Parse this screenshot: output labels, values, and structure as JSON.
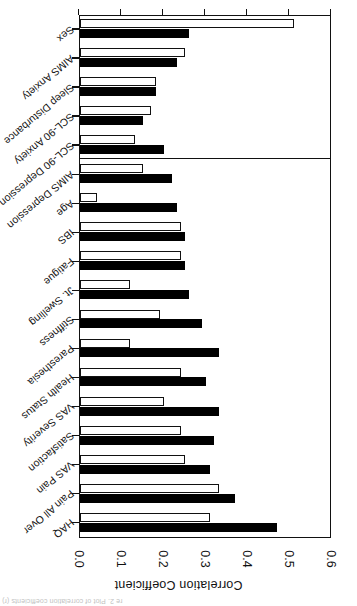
{
  "figure": {
    "cropped_caption": "re 2. Plot of correlation coefficients (r)",
    "orientation_note": "page scanned upside down"
  },
  "chart_data": {
    "type": "bar",
    "orientation": "horizontal",
    "title": "",
    "xlabel": "",
    "ylabel": "Correlation Coefficient",
    "axis_title": "Correlation Coefficient",
    "value_axis_ticks": [
      "0.0",
      "0.1",
      "0.2",
      "0.3",
      "0.4",
      "0.5",
      "0.6"
    ],
    "value_axis_tick_values": [
      0.0,
      0.1,
      0.2,
      0.3,
      0.4,
      0.5,
      0.6
    ],
    "xlim": [
      0.0,
      0.6
    ],
    "grid": false,
    "legend_position": "none",
    "separator_after_category_index": 12,
    "categories": [
      "HAQ",
      "Pain All Over",
      "VAS Pain",
      "Satisfaction",
      "VAS Severity",
      "Health Status",
      "Paresthesia",
      "Stiffness",
      "Jt. Swelling",
      "Fatigue",
      "IBS",
      "Age",
      "AIMS Depression",
      "SCL-90 Depression",
      "SCL-90 Anxiety",
      "Sleep Disturbance",
      "AIMS Anxiety",
      "Sex"
    ],
    "series": [
      {
        "name": "black",
        "fill": "#000000",
        "values": [
          0.47,
          0.37,
          0.31,
          0.32,
          0.33,
          0.3,
          0.33,
          0.29,
          0.26,
          0.25,
          0.25,
          0.23,
          0.22,
          0.2,
          0.15,
          0.18,
          0.23,
          0.26
        ]
      },
      {
        "name": "white",
        "fill": "#ffffff",
        "values": [
          0.31,
          0.33,
          0.25,
          0.24,
          0.2,
          0.24,
          0.12,
          0.19,
          0.12,
          0.24,
          0.24,
          0.04,
          0.15,
          0.13,
          0.17,
          0.18,
          0.25,
          0.51
        ]
      }
    ]
  }
}
